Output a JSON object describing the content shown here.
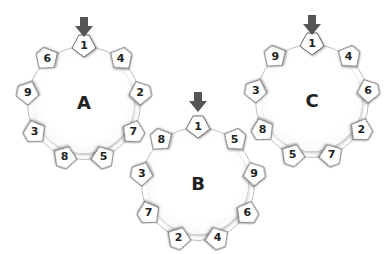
{
  "diagram": {
    "arrow_color": "#555555",
    "wheels": [
      {
        "id": "A",
        "label": "A",
        "center": [
          84,
          103
        ],
        "radius": 57,
        "arrow_top": 17,
        "tiles": [
          "1",
          "4",
          "2",
          "7",
          "5",
          "8",
          "3",
          "9",
          "6"
        ]
      },
      {
        "id": "B",
        "label": "B",
        "center": [
          198,
          184
        ],
        "radius": 57,
        "arrow_top": 92,
        "tiles": [
          "1",
          "5",
          "9",
          "6",
          "4",
          "2",
          "7",
          "3",
          "8"
        ]
      },
      {
        "id": "C",
        "label": "C",
        "center": [
          312,
          101
        ],
        "radius": 57,
        "arrow_top": 15,
        "tiles": [
          "1",
          "4",
          "6",
          "2",
          "7",
          "5",
          "8",
          "3",
          "9"
        ]
      }
    ]
  }
}
